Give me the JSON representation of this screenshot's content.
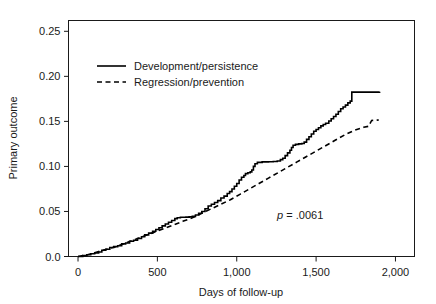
{
  "chart_data": {
    "type": "line",
    "title": "",
    "xlabel": "Days of follow-up",
    "ylabel": "Primary outcome",
    "xlim": [
      -60,
      2120
    ],
    "ylim": [
      0.0,
      0.262
    ],
    "grid": false,
    "legend_position": "upper-left-inside",
    "annotations": [
      {
        "name": "p-value",
        "text_italic": "p",
        "text": " = .0061",
        "x": 1400,
        "y": 0.042
      }
    ],
    "xticks": [
      0,
      500,
      1000,
      1500,
      2000
    ],
    "xtick_labels": [
      "0",
      "500",
      "1,000",
      "1,500",
      "2,000"
    ],
    "yticks": [
      0.0,
      0.05,
      0.1,
      0.15,
      0.2,
      0.25
    ],
    "ytick_labels": [
      "0.0",
      "0.05",
      "0.10",
      "0.15",
      "0.20",
      "0.25"
    ],
    "series": [
      {
        "name": "Development/persistence",
        "style": "solid",
        "color": "#000000",
        "step": true,
        "points": [
          [
            0,
            0.0
          ],
          [
            30,
            0.001
          ],
          [
            55,
            0.002
          ],
          [
            80,
            0.003
          ],
          [
            105,
            0.004
          ],
          [
            130,
            0.005
          ],
          [
            150,
            0.007
          ],
          [
            175,
            0.008
          ],
          [
            200,
            0.01
          ],
          [
            225,
            0.011
          ],
          [
            250,
            0.012
          ],
          [
            275,
            0.014
          ],
          [
            300,
            0.015
          ],
          [
            325,
            0.017
          ],
          [
            350,
            0.018
          ],
          [
            375,
            0.02
          ],
          [
            400,
            0.022
          ],
          [
            420,
            0.024
          ],
          [
            445,
            0.026
          ],
          [
            470,
            0.028
          ],
          [
            490,
            0.03
          ],
          [
            510,
            0.032
          ],
          [
            530,
            0.034
          ],
          [
            550,
            0.036
          ],
          [
            570,
            0.038
          ],
          [
            590,
            0.04
          ],
          [
            610,
            0.042
          ],
          [
            625,
            0.043
          ],
          [
            645,
            0.0435
          ],
          [
            680,
            0.0437
          ],
          [
            700,
            0.044
          ],
          [
            720,
            0.0445
          ],
          [
            740,
            0.046
          ],
          [
            760,
            0.048
          ],
          [
            780,
            0.05
          ],
          [
            800,
            0.053
          ],
          [
            820,
            0.056
          ],
          [
            840,
            0.058
          ],
          [
            860,
            0.06
          ],
          [
            880,
            0.062
          ],
          [
            900,
            0.065
          ],
          [
            920,
            0.067
          ],
          [
            940,
            0.07
          ],
          [
            955,
            0.072
          ],
          [
            970,
            0.075
          ],
          [
            985,
            0.078
          ],
          [
            1000,
            0.081
          ],
          [
            1015,
            0.085
          ],
          [
            1030,
            0.088
          ],
          [
            1045,
            0.09
          ],
          [
            1055,
            0.092
          ],
          [
            1070,
            0.093
          ],
          [
            1085,
            0.094
          ],
          [
            1095,
            0.096
          ],
          [
            1105,
            0.1
          ],
          [
            1115,
            0.103
          ],
          [
            1130,
            0.1045
          ],
          [
            1160,
            0.105
          ],
          [
            1200,
            0.1052
          ],
          [
            1230,
            0.1055
          ],
          [
            1255,
            0.106
          ],
          [
            1275,
            0.1075
          ],
          [
            1290,
            0.109
          ],
          [
            1305,
            0.112
          ],
          [
            1320,
            0.115
          ],
          [
            1335,
            0.118
          ],
          [
            1345,
            0.121
          ],
          [
            1355,
            0.1235
          ],
          [
            1370,
            0.1245
          ],
          [
            1390,
            0.125
          ],
          [
            1410,
            0.1255
          ],
          [
            1425,
            0.127
          ],
          [
            1440,
            0.13
          ],
          [
            1455,
            0.133
          ],
          [
            1470,
            0.136
          ],
          [
            1485,
            0.139
          ],
          [
            1500,
            0.141
          ],
          [
            1515,
            0.143
          ],
          [
            1530,
            0.145
          ],
          [
            1545,
            0.1465
          ],
          [
            1560,
            0.148
          ],
          [
            1580,
            0.1505
          ],
          [
            1595,
            0.153
          ],
          [
            1610,
            0.1555
          ],
          [
            1625,
            0.158
          ],
          [
            1640,
            0.161
          ],
          [
            1655,
            0.164
          ],
          [
            1670,
            0.166
          ],
          [
            1685,
            0.168
          ],
          [
            1700,
            0.1705
          ],
          [
            1715,
            0.1725
          ],
          [
            1725,
            0.1825
          ],
          [
            1900,
            0.183
          ]
        ]
      },
      {
        "name": "Regression/prevention",
        "style": "dashed",
        "color": "#000000",
        "step": false,
        "points": [
          [
            0,
            0.0
          ],
          [
            60,
            0.002
          ],
          [
            120,
            0.005
          ],
          [
            180,
            0.008
          ],
          [
            240,
            0.011
          ],
          [
            300,
            0.015
          ],
          [
            360,
            0.019
          ],
          [
            420,
            0.023
          ],
          [
            480,
            0.027
          ],
          [
            540,
            0.031
          ],
          [
            600,
            0.035
          ],
          [
            660,
            0.039
          ],
          [
            720,
            0.043
          ],
          [
            780,
            0.048
          ],
          [
            840,
            0.053
          ],
          [
            900,
            0.058
          ],
          [
            960,
            0.063
          ],
          [
            1020,
            0.069
          ],
          [
            1080,
            0.075
          ],
          [
            1140,
            0.081
          ],
          [
            1200,
            0.087
          ],
          [
            1260,
            0.093
          ],
          [
            1320,
            0.099
          ],
          [
            1380,
            0.105
          ],
          [
            1440,
            0.111
          ],
          [
            1500,
            0.117
          ],
          [
            1560,
            0.123
          ],
          [
            1620,
            0.129
          ],
          [
            1680,
            0.135
          ],
          [
            1740,
            0.14
          ],
          [
            1800,
            0.1435
          ],
          [
            1830,
            0.1445
          ],
          [
            1850,
            0.151
          ],
          [
            1895,
            0.1515
          ]
        ]
      }
    ]
  },
  "legend": {
    "items": [
      {
        "label": "Development/persistence",
        "style": "solid"
      },
      {
        "label": "Regression/prevention",
        "style": "dashed"
      }
    ]
  }
}
